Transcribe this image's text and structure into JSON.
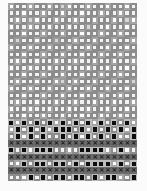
{
  "document": {
    "type": "scanned-checkbox-grid",
    "columns": 20,
    "rows": 26,
    "legend": {
      "o": "empty-box",
      "g": "smudged-box",
      "b": "filled-box",
      "x": "crossed-box"
    },
    "colors": {
      "paper": "#fbfbfb",
      "box_border": "#8c8c8c",
      "filled": "#0d0d0d",
      "cross": "#1a1a1a"
    },
    "grid": [
      "oooooooogooooooooooo",
      "oooooooooooooooooooo",
      "ooogoooooooooooooogo",
      "oooooooooooogooooooo",
      "oooooooooooooooooooo",
      "ogooooogoooooooooooo",
      "oooooooooooooooooooo",
      "oooooooooooooooooooo",
      "oooooooooooooooooooo",
      "oooooooooooooooooooo",
      "oooooooooooooooooooo",
      "oooooooogoooooooooog",
      "oooooooooooooooooooo",
      "oooooooooooooooooooo",
      "oooooooooooooooooooo",
      "ooooooooooooooooooooo",
      "oooooooooooooooooooo",
      "bobobobobobobobobobo",
      "obobobobbbobobobobob",
      "obobobooboboboboboob",
      "xxxxxxxxxxxxxxxxxxxx",
      "bobobbboooobbbbooboo",
      "xxxxxxxxxxxxxxxxxxxx",
      "oobobbobbobobbbbobob",
      "xxxxxxxxxxxxxxxxxxxx",
      "ooobobobbobbobobboob"
    ]
  }
}
